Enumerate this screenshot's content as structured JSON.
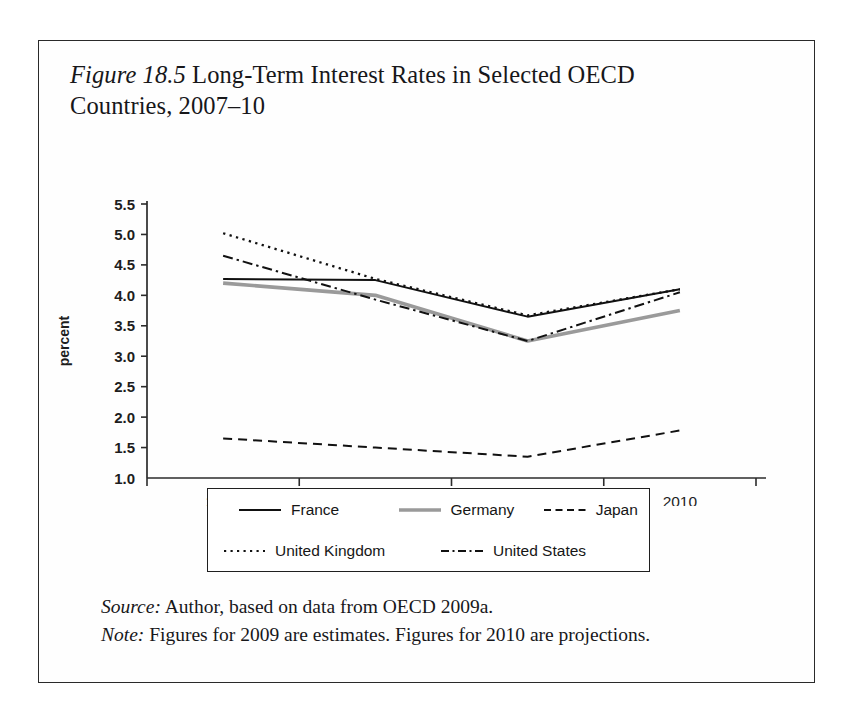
{
  "figure": {
    "label": "Figure 18.5",
    "title_text": " Long-Term Interest Rates in Selected OECD Countries, 2007–10",
    "source_lead": "Source:",
    "source_text": " Author, based on data from OECD 2009a.",
    "note_lead": "Note:",
    "note_text": " Figures for 2009 are estimates. Figures for 2010 are projections."
  },
  "axes": {
    "ylabel": "percent",
    "yticks": [
      "5.5",
      "5.0",
      "4.5",
      "4.0",
      "3.5",
      "3.0",
      "2.5",
      "2.0",
      "1.5",
      "1.0"
    ],
    "xticks": [
      "2007",
      "2008",
      "2009",
      "2010"
    ]
  },
  "legend": {
    "entries": [
      {
        "label": "France",
        "style": "solid-black",
        "color": "#111111"
      },
      {
        "label": "Germany",
        "style": "solid-gray",
        "color": "#9a9a9a"
      },
      {
        "label": "Japan",
        "style": "dashed",
        "color": "#111111"
      },
      {
        "label": "United Kingdom",
        "style": "dotted",
        "color": "#111111"
      },
      {
        "label": "United States",
        "style": "dash-dot",
        "color": "#111111"
      }
    ]
  },
  "chart_data": {
    "type": "line",
    "title": "Figure 18.5 Long-Term Interest Rates in Selected OECD Countries, 2007–10",
    "xlabel": "",
    "ylabel": "percent",
    "categories": [
      "2007",
      "2008",
      "2009",
      "2010"
    ],
    "x": [
      2007,
      2008,
      2009,
      2010
    ],
    "ylim": [
      1.0,
      5.5
    ],
    "ytick_step": 0.5,
    "grid": false,
    "legend_position": "below-plot",
    "series": [
      {
        "name": "France",
        "style": "solid-black",
        "color": "#111111",
        "values": [
          4.27,
          4.25,
          3.65,
          4.1
        ]
      },
      {
        "name": "Germany",
        "style": "solid-gray",
        "color": "#9a9a9a",
        "values": [
          4.2,
          4.0,
          3.25,
          3.75
        ]
      },
      {
        "name": "Japan",
        "style": "dashed",
        "color": "#111111",
        "values": [
          1.65,
          1.5,
          1.35,
          1.78
        ]
      },
      {
        "name": "United Kingdom",
        "style": "dotted",
        "color": "#111111",
        "values": [
          5.02,
          4.27,
          3.67,
          4.1
        ]
      },
      {
        "name": "United States",
        "style": "dash-dot",
        "color": "#111111",
        "values": [
          4.65,
          3.93,
          3.25,
          4.05
        ]
      }
    ]
  }
}
